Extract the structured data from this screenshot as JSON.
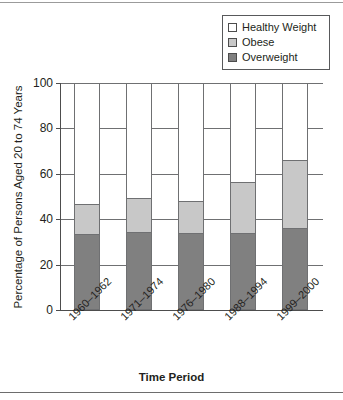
{
  "chart_data": {
    "type": "bar",
    "subtype": "stacked-100",
    "title": "",
    "xlabel": "Time Period",
    "ylabel": "Percentage of Persons Aged 20 to 74 Years",
    "categories": [
      "1960–1962",
      "1971–1974",
      "1976–1980",
      "1988–1994",
      "1999–2000"
    ],
    "series": [
      {
        "name": "Overweight",
        "color": "#808080",
        "values": [
          33,
          34,
          33.5,
          33.5,
          35.5
        ]
      },
      {
        "name": "Obese",
        "color": "#c8c8c8",
        "values": [
          13.5,
          15.5,
          14.5,
          23,
          30.5
        ]
      },
      {
        "name": "Healthy Weight",
        "color": "#ffffff",
        "values": [
          53.5,
          50.5,
          52,
          43.5,
          34
        ]
      }
    ],
    "cumulative_tops": {
      "overweight": [
        33,
        34,
        33.5,
        33.5,
        35.5
      ],
      "obese_top": [
        46.5,
        49.5,
        48,
        56.5,
        66
      ]
    },
    "ylim": [
      0,
      100
    ],
    "yticks": [
      0,
      20,
      40,
      60,
      80,
      100
    ],
    "ytick_labels": [
      "0",
      "20",
      "40",
      "60",
      "80",
      "100"
    ],
    "grid": "horizontal",
    "legend_position": "top-right",
    "legend_order": [
      "Healthy Weight",
      "Obese",
      "Overweight"
    ]
  },
  "legend": {
    "items": [
      {
        "label": "Healthy Weight",
        "swatch": "#ffffff",
        "icon": "legend-swatch-healthy-weight"
      },
      {
        "label": "Obese",
        "swatch": "#c8c8c8",
        "icon": "legend-swatch-obese"
      },
      {
        "label": "Overweight",
        "swatch": "#808080",
        "icon": "legend-swatch-overweight"
      }
    ]
  },
  "axes": {
    "y_title": "Percentage of Persons Aged 20 to 74 Years",
    "x_title": "Time Period",
    "y_ticks": [
      "0",
      "20",
      "40",
      "60",
      "80",
      "100"
    ],
    "x_ticks": [
      "1960–1962",
      "1971–1974",
      "1976–1980",
      "1988–1994",
      "1999–2000"
    ]
  },
  "colors": {
    "overweight": "#808080",
    "obese": "#c8c8c8",
    "healthy_weight": "#ffffff",
    "axis": "#4d4d4d",
    "grid": "#6f7072",
    "text": "#231f20"
  }
}
